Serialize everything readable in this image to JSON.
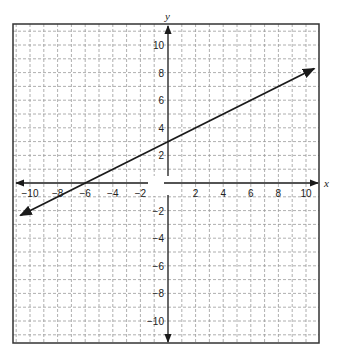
{
  "chart_data": {
    "type": "line",
    "title": "",
    "xlabel": "x",
    "ylabel": "y",
    "xlim": [
      -10,
      10
    ],
    "ylim": [
      -10,
      10
    ],
    "grid": true,
    "grid_style": "dashed",
    "grid_step": 1,
    "x_ticks": [
      -10,
      -8,
      -6,
      -4,
      -2,
      2,
      4,
      6,
      8,
      10
    ],
    "y_ticks": [
      -10,
      -8,
      -6,
      -4,
      -2,
      2,
      4,
      6,
      8,
      10
    ],
    "x_tick_labels": [
      "−10",
      "−8",
      "−6",
      "−4",
      "−2",
      "2",
      "4",
      "6",
      "8",
      "10"
    ],
    "y_tick_labels": [
      "−10",
      "−8",
      "−6",
      "−4",
      "−2",
      "2",
      "4",
      "6",
      "8",
      "10"
    ],
    "series": [
      {
        "name": "line",
        "equation": "y = 0.5x + 3",
        "slope": 0.5,
        "y_intercept": 3,
        "x_intercept": -6,
        "x": [
          -10.7,
          -6,
          0,
          10.6
        ],
        "y": [
          -2.35,
          0,
          3,
          8.3
        ],
        "arrows": "both"
      }
    ],
    "colors": {
      "line": "#1a1a1a",
      "axis": "#1a1a1a",
      "grid": "#9a9a9a",
      "frame": "#333333"
    }
  }
}
